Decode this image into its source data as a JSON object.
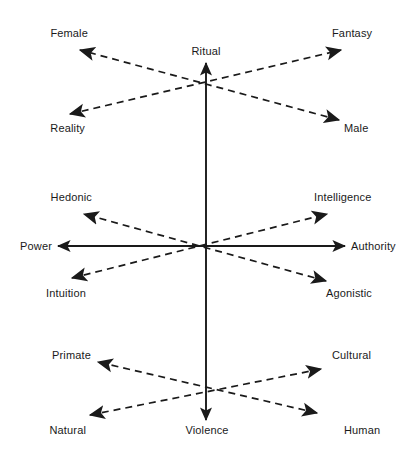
{
  "diagram": {
    "title": "",
    "type": "bipolar-axis-diagram",
    "background_color": "#ffffff",
    "line_color": "#1a1a1a",
    "text_color": "#1a1a1a",
    "center": {
      "x": 206,
      "y": 246
    },
    "axes": [
      {
        "id": "vertical-main",
        "style": "solid",
        "orientation": "vertical",
        "positive_label": "Ritual",
        "negative_label": "Violence"
      },
      {
        "id": "horizontal-main",
        "style": "solid",
        "orientation": "horizontal",
        "negative_label": "Power",
        "positive_label": "Authority"
      },
      {
        "id": "upper-diagonal-a",
        "style": "dashed",
        "orientation": "diagonal-up-left",
        "negative_label": "Female",
        "positive_label": "Male"
      },
      {
        "id": "upper-diagonal-b",
        "style": "dashed",
        "orientation": "diagonal-up-right",
        "negative_label": "Reality",
        "positive_label": "Fantasy"
      },
      {
        "id": "middle-diagonal-a",
        "style": "dashed",
        "orientation": "diagonal-up-left",
        "negative_label": "Hedonic",
        "positive_label": "Agonistic"
      },
      {
        "id": "middle-diagonal-b",
        "style": "dashed",
        "orientation": "diagonal-up-right",
        "negative_label": "Intuition",
        "positive_label": "Intelligence"
      },
      {
        "id": "lower-diagonal-a",
        "style": "dashed",
        "orientation": "diagonal-up-left",
        "negative_label": "Primate",
        "positive_label": "Human"
      },
      {
        "id": "lower-diagonal-b",
        "style": "dashed",
        "orientation": "diagonal-up-right",
        "negative_label": "Natural",
        "positive_label": "Cultural"
      }
    ],
    "labels": {
      "female": "Female",
      "fantasy": "Fantasy",
      "ritual": "Ritual",
      "reality": "Reality",
      "male": "Male",
      "hedonic": "Hedonic",
      "intelligence": "Intelligence",
      "power": "Power",
      "authority": "Authority",
      "intuition": "Intuition",
      "agonistic": "Agonistic",
      "primate": "Primate",
      "cultural": "Cultural",
      "natural": "Natural",
      "violence": "Violence",
      "human": "Human"
    }
  }
}
